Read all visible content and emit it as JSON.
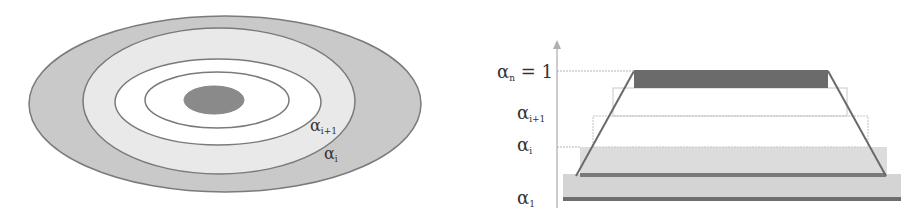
{
  "left_diagram": {
    "title": "Nested alpha-cut contours",
    "labels": {
      "inner_contour": {
        "base": "α",
        "sub": "i+1"
      },
      "outer_contour": {
        "base": "α",
        "sub": "i"
      }
    },
    "colors": {
      "outer_band": "#c9c9c9",
      "mid_band": "#e9e9e9",
      "inner_band": "#ffffff",
      "core": "#8a8a8a",
      "stroke": "#7a7a7a"
    }
  },
  "right_diagram": {
    "title": "Trapezoidal membership with alpha levels",
    "axis_labels": {
      "top": {
        "base": "α",
        "sub": "n",
        "suffix": " = 1"
      },
      "upper": {
        "base": "α",
        "sub": "i+1"
      },
      "middle": {
        "base": "α",
        "sub": "i"
      },
      "bottom": {
        "base": "α",
        "sub": "1"
      }
    },
    "levels": [
      {
        "name": "alpha-1",
        "fill": "#d4d4d4",
        "fraction": 0.0
      },
      {
        "name": "alpha-i",
        "fill": "#dcdcdc",
        "fraction": 0.33
      },
      {
        "name": "alpha-i+1",
        "fill": "#ffffff",
        "fraction": 0.66
      },
      {
        "name": "alpha-n",
        "fill": "#6b6b6b",
        "fraction": 1.0
      }
    ],
    "colors": {
      "axis": "#9a9a9a",
      "trapezoid_edge": "#6a6a6a",
      "dotted": "#b5b5b5"
    }
  }
}
